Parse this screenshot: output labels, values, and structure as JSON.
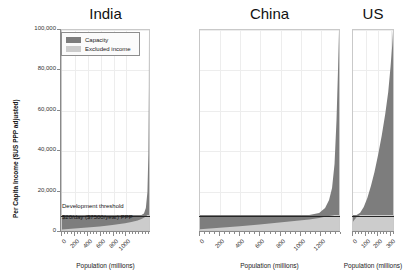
{
  "chart_data": {
    "type": "area",
    "title": "",
    "ylabel": "Per Capita Income ($US PPP adjusted)",
    "xlabel": "Population (millions)",
    "ylim": [
      0,
      100000
    ],
    "yticks": [
      "0",
      "20,000",
      "40,000",
      "60,000",
      "80,000",
      "100,000"
    ],
    "ytick_values": [
      0,
      20000,
      40000,
      60000,
      80000,
      100000
    ],
    "grid": true,
    "legend": {
      "position": "top-left-india",
      "entries": [
        {
          "label": "Capacity",
          "color": "#7d7d7d"
        },
        {
          "label": "Excluded income",
          "color": "#cccccc"
        }
      ]
    },
    "annotations": [
      {
        "name": "development-threshold",
        "line1": "Development threshold",
        "line2": "$20/day ($7500/year) PPP",
        "value": 7500
      }
    ],
    "panels": [
      {
        "name": "india",
        "title": "India",
        "xlabel": "Population (millions)",
        "xlim": [
          0,
          1380
        ],
        "xticks": [
          "0",
          "200",
          "400",
          "600",
          "800",
          "1000"
        ],
        "xtick_values": [
          0,
          200,
          400,
          600,
          800,
          1000
        ],
        "width_share": 1380,
        "series": [
          {
            "name": "Capacity",
            "color": "#7d7d7d",
            "x": [
              0,
              200,
              400,
              600,
              800,
              1000,
              1100,
              1200,
              1260,
              1300,
              1330,
              1355,
              1370,
              1378,
              1380
            ],
            "y": [
              7500,
              7500,
              7500,
              7500,
              7500,
              7500,
              7500,
              7500,
              7500,
              8200,
              11000,
              19000,
              38000,
              72000,
              100000
            ]
          },
          {
            "name": "Excluded income",
            "color": "#cccccc",
            "x": [
              0,
              200,
              400,
              600,
              800,
              1000,
              1100,
              1200,
              1260,
              1300,
              1330,
              1355,
              1370,
              1378,
              1380
            ],
            "y": [
              300,
              700,
              1200,
              1800,
              2500,
              3400,
              4000,
              4800,
              5500,
              6100,
              6800,
              7500,
              7500,
              7500,
              7500
            ]
          }
        ]
      },
      {
        "name": "china",
        "title": "China",
        "xlabel": "Population (millions)",
        "xlim": [
          0,
          1400
        ],
        "xticks": [
          "0",
          "200",
          "400",
          "600",
          "800",
          "1000",
          "1200"
        ],
        "xtick_values": [
          0,
          200,
          400,
          600,
          800,
          1000,
          1200
        ],
        "width_share": 1400,
        "series": [
          {
            "name": "Capacity",
            "color": "#7d7d7d",
            "x": [
              0,
              200,
              400,
              600,
              800,
              1000,
              1100,
              1200,
              1260,
              1300,
              1330,
              1355,
              1375,
              1390,
              1400
            ],
            "y": [
              7500,
              7500,
              7500,
              7500,
              7500,
              7500,
              7500,
              8500,
              11000,
              15000,
              21000,
              33000,
              55000,
              80000,
              100000
            ]
          },
          {
            "name": "Excluded income",
            "color": "#cccccc",
            "x": [
              0,
              200,
              400,
              600,
              800,
              1000,
              1100,
              1200,
              1260,
              1300,
              1330,
              1355,
              1375,
              1390,
              1400
            ],
            "y": [
              400,
              1100,
              1900,
              2800,
              3700,
              4700,
              5300,
              6000,
              6600,
              7000,
              7300,
              7500,
              7500,
              7500,
              7500
            ]
          }
        ]
      },
      {
        "name": "us",
        "title": "US",
        "xlabel": "Population (millions)",
        "xlim": [
          0,
          335
        ],
        "xticks": [
          "0",
          "100",
          "200",
          "300"
        ],
        "xtick_values": [
          0,
          100,
          200,
          300
        ],
        "width_share": 335,
        "series": [
          {
            "name": "Capacity",
            "color": "#7d7d7d",
            "x": [
              0,
              30,
              60,
              90,
              120,
              150,
              180,
              210,
              240,
              270,
              295,
              315,
              328,
              335
            ],
            "y": [
              7500,
              7500,
              8600,
              11500,
              16000,
              22000,
              29000,
              37500,
              47000,
              58000,
              69000,
              82000,
              92000,
              100000
            ]
          },
          {
            "name": "Excluded income",
            "color": "#cccccc",
            "x": [
              0,
              30,
              60,
              90,
              120,
              150,
              180,
              210,
              240,
              270,
              295,
              315,
              328,
              335
            ],
            "y": [
              4200,
              6400,
              7500,
              7500,
              7500,
              7500,
              7500,
              7500,
              7500,
              7500,
              7500,
              7500,
              7500,
              7500
            ]
          }
        ]
      }
    ]
  },
  "colors": {
    "capacity": "#7d7d7d",
    "excluded_income": "#cccccc",
    "threshold_line": "#262626",
    "axis": "#8a8a8a",
    "grid": "#ededed",
    "background": "#ffffff"
  }
}
